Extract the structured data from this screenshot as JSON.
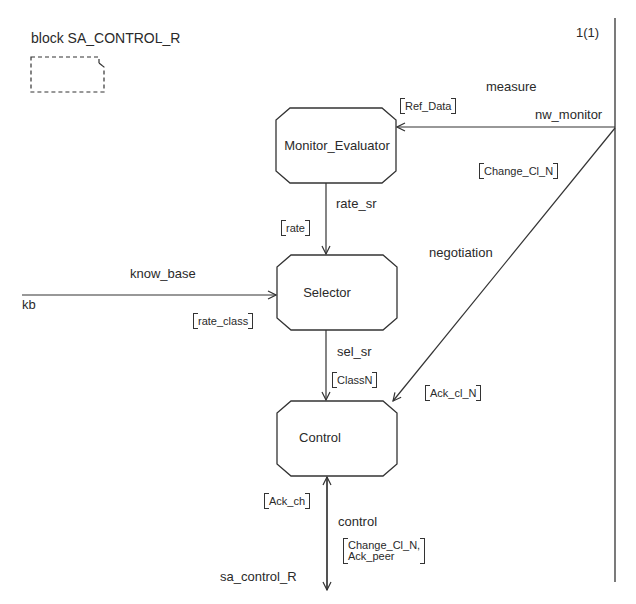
{
  "diagram": {
    "title": "block SA_CONTROL_R",
    "page": "1(1)",
    "blocks": [
      {
        "id": "monitor_evaluator",
        "label": "Monitor_Evaluator"
      },
      {
        "id": "selector",
        "label": "Selector"
      },
      {
        "id": "control",
        "label": "Control"
      }
    ],
    "channels": {
      "measure": {
        "name": "measure",
        "gate": "nw_monitor",
        "signals": "Ref_Data"
      },
      "negotiation": {
        "name": "negotiation",
        "signals_in": "Change_Cl_N",
        "signals_out": "Ack_cl_N"
      },
      "rate_sr": {
        "name": "rate_sr",
        "signals": "rate"
      },
      "know_base": {
        "name": "know_base",
        "gate": "kb",
        "signals": "rate_class"
      },
      "sel_sr": {
        "name": "sel_sr",
        "signals": "ClassN"
      },
      "control": {
        "name": "control",
        "gate": "sa_control_R",
        "signals_up": "Ack_ch",
        "signals_down_1": "Change_Cl_N,",
        "signals_down_2": "Ack_peer"
      }
    },
    "colors": {
      "line": "#333333",
      "background": "#ffffff"
    }
  }
}
